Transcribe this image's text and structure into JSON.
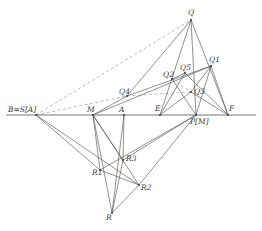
{
  "figure": {
    "background_color": "#ffffff",
    "line_color": "#555555",
    "baseline_color": "#777777",
    "dashed_color": "#9a9a9a",
    "label_color": "#3a3a3a",
    "point_color": "#444444"
  },
  "points": {
    "B": {
      "label": "B",
      "equals": "=",
      "map": "S",
      "bracket_open": "[",
      "arg": "A",
      "bracket_close": "]",
      "x": 36,
      "y": 115
    },
    "M": {
      "label": "M",
      "x": 93,
      "y": 115
    },
    "A": {
      "label": "A",
      "x": 124,
      "y": 115
    },
    "E": {
      "label": "E",
      "x": 160,
      "y": 115
    },
    "P": {
      "label": "P",
      "bracket_open": "[",
      "arg": "M",
      "bracket_close": "]",
      "x": 196,
      "y": 115
    },
    "F": {
      "label": "F",
      "x": 228,
      "y": 115
    },
    "Q": {
      "label": "Q",
      "x": 191,
      "y": 20
    },
    "Q1": {
      "label": "Q",
      "sub": "1",
      "x": 211,
      "y": 66
    },
    "Q2": {
      "label": "Q",
      "sub": "2",
      "x": 172,
      "y": 79
    },
    "Q3": {
      "label": "Q",
      "sub": "3",
      "x": 191,
      "y": 92
    },
    "Q4": {
      "label": "Q",
      "sub": "4",
      "x": 127,
      "y": 96
    },
    "Q5": {
      "label": "Q",
      "sub": "5",
      "x": 185,
      "y": 73
    },
    "R": {
      "label": "R",
      "x": 112,
      "y": 213
    },
    "R1": {
      "label": "R",
      "sub": "1",
      "x": 100,
      "y": 170
    },
    "R2": {
      "label": "R",
      "sub": "2",
      "x": 139,
      "y": 185
    },
    "R3": {
      "label": "R",
      "sub": "3",
      "x": 123,
      "y": 160
    }
  },
  "labels": {
    "B_text": "B=S[A]",
    "M_text": "M",
    "A_text": "A",
    "E_text": "E",
    "P_text": "P[M]",
    "F_text": "F",
    "Q_text": "Q",
    "Q1_text": "Q1",
    "Q2_text": "Q2",
    "Q3_text": "Q3",
    "Q4_text": "Q4",
    "Q5_text": "Q5",
    "R_text": "R",
    "R1_text": "R1",
    "R2_text": "R2",
    "R3_text": "R3"
  },
  "segments_solid": [
    {
      "name": "baseline",
      "x1": 6,
      "y1": 115,
      "x2": 256,
      "y2": 115
    },
    {
      "name": "Q-to-P",
      "x1": 191,
      "y1": 20,
      "x2": 196,
      "y2": 115
    },
    {
      "name": "Q-to-E",
      "x1": 191,
      "y1": 20,
      "x2": 160,
      "y2": 115
    },
    {
      "name": "Q-to-F",
      "x1": 191,
      "y1": 20,
      "x2": 228,
      "y2": 115
    },
    {
      "name": "Q-to-Q4",
      "x1": 191,
      "y1": 20,
      "x2": 127,
      "y2": 96
    },
    {
      "name": "Q4-to-Q1",
      "x1": 127,
      "y1": 96,
      "x2": 211,
      "y2": 66
    },
    {
      "name": "Q1-to-P",
      "x1": 211,
      "y1": 66,
      "x2": 196,
      "y2": 115
    },
    {
      "name": "Q1-to-F",
      "x1": 211,
      "y1": 66,
      "x2": 228,
      "y2": 115
    },
    {
      "name": "Q2-to-P",
      "x1": 172,
      "y1": 79,
      "x2": 196,
      "y2": 115
    },
    {
      "name": "E-to-Q5",
      "x1": 160,
      "y1": 115,
      "x2": 185,
      "y2": 73
    },
    {
      "name": "Q5-to-F",
      "x1": 185,
      "y1": 73,
      "x2": 228,
      "y2": 115
    },
    {
      "name": "M-to-Q4",
      "x1": 93,
      "y1": 115,
      "x2": 127,
      "y2": 96
    },
    {
      "name": "M-to-R",
      "x1": 93,
      "y1": 115,
      "x2": 112,
      "y2": 213
    },
    {
      "name": "M-to-R1",
      "x1": 93,
      "y1": 115,
      "x2": 100,
      "y2": 170
    },
    {
      "name": "M-to-R2",
      "x1": 93,
      "y1": 115,
      "x2": 139,
      "y2": 185
    },
    {
      "name": "M-to-R3",
      "x1": 93,
      "y1": 115,
      "x2": 123,
      "y2": 160
    },
    {
      "name": "A-to-R",
      "x1": 124,
      "y1": 115,
      "x2": 112,
      "y2": 213
    },
    {
      "name": "A-to-R3",
      "x1": 124,
      "y1": 115,
      "x2": 123,
      "y2": 160
    },
    {
      "name": "B-to-R2",
      "x1": 36,
      "y1": 115,
      "x2": 139,
      "y2": 185
    },
    {
      "name": "B-to-R1",
      "x1": 36,
      "y1": 115,
      "x2": 100,
      "y2": 170
    },
    {
      "name": "R1-to-R2",
      "x1": 100,
      "y1": 170,
      "x2": 139,
      "y2": 185
    },
    {
      "name": "R1-to-P",
      "x1": 100,
      "y1": 170,
      "x2": 196,
      "y2": 115
    },
    {
      "name": "R2-to-P",
      "x1": 139,
      "y1": 185,
      "x2": 196,
      "y2": 115
    },
    {
      "name": "R3-to-R",
      "x1": 123,
      "y1": 160,
      "x2": 112,
      "y2": 213
    },
    {
      "name": "R-to-R2",
      "x1": 112,
      "y1": 213,
      "x2": 139,
      "y2": 185
    }
  ],
  "segments_dashed": [
    {
      "name": "B-to-Q",
      "x1": 36,
      "y1": 115,
      "x2": 191,
      "y2": 20
    },
    {
      "name": "B-to-Q4",
      "x1": 36,
      "y1": 115,
      "x2": 127,
      "y2": 96
    },
    {
      "name": "Q4-to-Q3",
      "x1": 127,
      "y1": 96,
      "x2": 191,
      "y2": 92
    },
    {
      "name": "Q2-to-Q3",
      "x1": 172,
      "y1": 79,
      "x2": 191,
      "y2": 92
    }
  ]
}
